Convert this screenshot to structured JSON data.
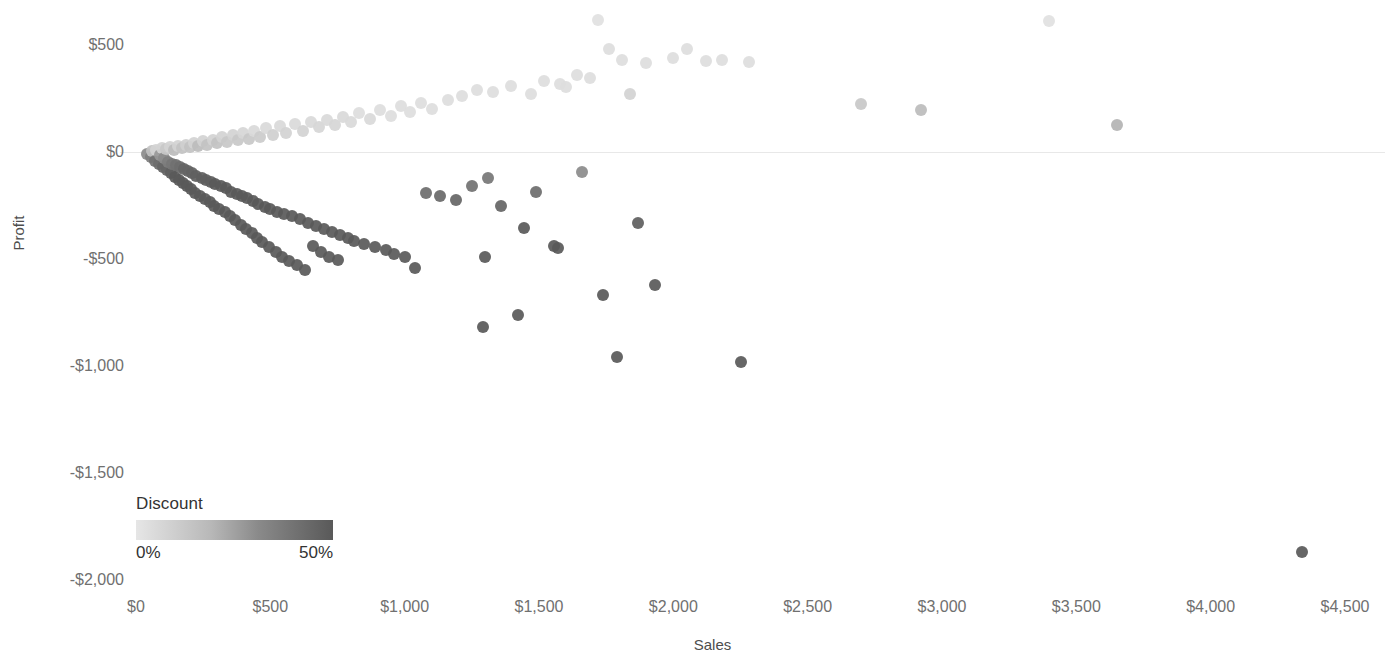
{
  "chart_data": {
    "type": "scatter",
    "title": "",
    "xlabel": "Sales",
    "ylabel": "Profit",
    "xlim": [
      0,
      4650
    ],
    "ylim": [
      -2000,
      650
    ],
    "grid": false,
    "x_tick_labels": [
      "$0",
      "$500",
      "$1,000",
      "$1,500",
      "$2,000",
      "$2,500",
      "$3,000",
      "$3,500",
      "$4,000",
      "$4,500"
    ],
    "x_tick_values": [
      0,
      500,
      1000,
      1500,
      2000,
      2500,
      3000,
      3500,
      4000,
      4500
    ],
    "y_tick_labels": [
      "$500",
      "$0",
      "-$500",
      "-$1,000",
      "-$1,500",
      "-$2,000"
    ],
    "y_tick_values": [
      500,
      0,
      -500,
      -1000,
      -1500,
      -2000
    ],
    "reference_line_y": 0,
    "color_encoding": {
      "field": "Discount",
      "min_label": "0%",
      "max_label": "50%",
      "min_value": 0,
      "max_value": 0.5,
      "min_color": "#e6e6e6",
      "max_color": "#595959",
      "legend_position": "bottom-left"
    },
    "marker": {
      "shape": "circle",
      "size_px": 12,
      "opacity": 0.92
    },
    "points": [
      [
        40,
        -10,
        0.3
      ],
      [
        55,
        -25,
        0.35
      ],
      [
        60,
        5,
        0.1
      ],
      [
        70,
        -40,
        0.4
      ],
      [
        75,
        10,
        0.05
      ],
      [
        85,
        -55,
        0.42
      ],
      [
        90,
        -15,
        0.25
      ],
      [
        95,
        20,
        0.05
      ],
      [
        100,
        -70,
        0.45
      ],
      [
        105,
        -30,
        0.3
      ],
      [
        110,
        15,
        0.08
      ],
      [
        115,
        -85,
        0.45
      ],
      [
        120,
        -45,
        0.35
      ],
      [
        125,
        25,
        0.05
      ],
      [
        130,
        -100,
        0.48
      ],
      [
        135,
        -55,
        0.38
      ],
      [
        140,
        8,
        0.12
      ],
      [
        145,
        -115,
        0.5
      ],
      [
        150,
        -60,
        0.4
      ],
      [
        155,
        30,
        0.05
      ],
      [
        160,
        -130,
        0.5
      ],
      [
        165,
        -70,
        0.42
      ],
      [
        170,
        18,
        0.1
      ],
      [
        175,
        -145,
        0.5
      ],
      [
        180,
        -80,
        0.45
      ],
      [
        185,
        35,
        0.06
      ],
      [
        190,
        -160,
        0.5
      ],
      [
        195,
        -90,
        0.45
      ],
      [
        200,
        22,
        0.1
      ],
      [
        205,
        -175,
        0.5
      ],
      [
        210,
        -100,
        0.46
      ],
      [
        215,
        42,
        0.05
      ],
      [
        220,
        -190,
        0.5
      ],
      [
        225,
        -110,
        0.47
      ],
      [
        230,
        28,
        0.12
      ],
      [
        240,
        -205,
        0.5
      ],
      [
        245,
        -120,
        0.48
      ],
      [
        250,
        50,
        0.05
      ],
      [
        255,
        -220,
        0.5
      ],
      [
        260,
        -130,
        0.48
      ],
      [
        265,
        35,
        0.1
      ],
      [
        275,
        -235,
        0.5
      ],
      [
        280,
        -140,
        0.48
      ],
      [
        285,
        58,
        0.05
      ],
      [
        290,
        -250,
        0.5
      ],
      [
        295,
        -150,
        0.5
      ],
      [
        300,
        40,
        0.1
      ],
      [
        310,
        -265,
        0.5
      ],
      [
        315,
        -160,
        0.5
      ],
      [
        320,
        68,
        0.05
      ],
      [
        330,
        -280,
        0.5
      ],
      [
        335,
        -170,
        0.5
      ],
      [
        340,
        48,
        0.08
      ],
      [
        350,
        -300,
        0.5
      ],
      [
        355,
        -185,
        0.5
      ],
      [
        360,
        78,
        0.05
      ],
      [
        370,
        -320,
        0.5
      ],
      [
        375,
        -195,
        0.5
      ],
      [
        380,
        55,
        0.08
      ],
      [
        390,
        -340,
        0.5
      ],
      [
        395,
        -205,
        0.5
      ],
      [
        400,
        88,
        0.04
      ],
      [
        410,
        -360,
        0.5
      ],
      [
        415,
        -215,
        0.5
      ],
      [
        420,
        62,
        0.08
      ],
      [
        430,
        -380,
        0.5
      ],
      [
        435,
        -230,
        0.5
      ],
      [
        440,
        98,
        0.03
      ],
      [
        450,
        -400,
        0.5
      ],
      [
        455,
        -245,
        0.5
      ],
      [
        460,
        70,
        0.07
      ],
      [
        470,
        -420,
        0.5
      ],
      [
        480,
        -255,
        0.5
      ],
      [
        485,
        110,
        0.03
      ],
      [
        495,
        -445,
        0.5
      ],
      [
        500,
        -265,
        0.5
      ],
      [
        510,
        80,
        0.06
      ],
      [
        520,
        -465,
        0.5
      ],
      [
        525,
        -280,
        0.5
      ],
      [
        535,
        120,
        0.03
      ],
      [
        545,
        -490,
        0.5
      ],
      [
        550,
        -290,
        0.5
      ],
      [
        560,
        90,
        0.05
      ],
      [
        570,
        -510,
        0.5
      ],
      [
        580,
        -300,
        0.5
      ],
      [
        590,
        130,
        0.03
      ],
      [
        600,
        -530,
        0.5
      ],
      [
        610,
        -315,
        0.5
      ],
      [
        620,
        100,
        0.05
      ],
      [
        630,
        -550,
        0.5
      ],
      [
        640,
        -330,
        0.5
      ],
      [
        650,
        140,
        0.03
      ],
      [
        660,
        -440,
        0.5
      ],
      [
        670,
        -345,
        0.5
      ],
      [
        680,
        115,
        0.04
      ],
      [
        690,
        -465,
        0.5
      ],
      [
        700,
        -360,
        0.5
      ],
      [
        710,
        150,
        0.03
      ],
      [
        720,
        -490,
        0.5
      ],
      [
        730,
        -375,
        0.5
      ],
      [
        740,
        125,
        0.04
      ],
      [
        750,
        -505,
        0.5
      ],
      [
        760,
        -390,
        0.5
      ],
      [
        770,
        165,
        0.03
      ],
      [
        790,
        -400,
        0.5
      ],
      [
        800,
        140,
        0.03
      ],
      [
        810,
        -415,
        0.5
      ],
      [
        830,
        180,
        0.02
      ],
      [
        850,
        -430,
        0.5
      ],
      [
        870,
        155,
        0.03
      ],
      [
        890,
        -445,
        0.5
      ],
      [
        910,
        195,
        0.02
      ],
      [
        930,
        -460,
        0.5
      ],
      [
        950,
        170,
        0.02
      ],
      [
        960,
        -475,
        0.5
      ],
      [
        985,
        215,
        0.02
      ],
      [
        1000,
        -490,
        0.5
      ],
      [
        1020,
        185,
        0.02
      ],
      [
        1040,
        -540,
        0.5
      ],
      [
        1060,
        230,
        0.02
      ],
      [
        1080,
        -190,
        0.42
      ],
      [
        1100,
        200,
        0.02
      ],
      [
        1130,
        -205,
        0.44
      ],
      [
        1160,
        245,
        0.02
      ],
      [
        1190,
        -225,
        0.45
      ],
      [
        1215,
        260,
        0.02
      ],
      [
        1250,
        -160,
        0.4
      ],
      [
        1270,
        290,
        0.02
      ],
      [
        1290,
        -820,
        0.5
      ],
      [
        1300,
        -490,
        0.5
      ],
      [
        1310,
        -120,
        0.38
      ],
      [
        1330,
        280,
        0.02
      ],
      [
        1360,
        -250,
        0.45
      ],
      [
        1395,
        310,
        0.02
      ],
      [
        1420,
        -760,
        0.5
      ],
      [
        1445,
        -355,
        0.5
      ],
      [
        1470,
        270,
        0.02
      ],
      [
        1490,
        -185,
        0.42
      ],
      [
        1520,
        330,
        0.02
      ],
      [
        1555,
        -440,
        0.5
      ],
      [
        1570,
        -450,
        0.5
      ],
      [
        1580,
        320,
        0.02
      ],
      [
        1600,
        305,
        0.02
      ],
      [
        1640,
        360,
        0.02
      ],
      [
        1660,
        -95,
        0.3
      ],
      [
        1690,
        345,
        0.02
      ],
      [
        1720,
        615,
        0.01
      ],
      [
        1740,
        -670,
        0.5
      ],
      [
        1760,
        480,
        0.02
      ],
      [
        1790,
        -960,
        0.5
      ],
      [
        1810,
        430,
        0.02
      ],
      [
        1840,
        270,
        0.05
      ],
      [
        1870,
        -330,
        0.48
      ],
      [
        1900,
        415,
        0.02
      ],
      [
        1930,
        -620,
        0.5
      ],
      [
        2000,
        440,
        0.02
      ],
      [
        2050,
        480,
        0.02
      ],
      [
        2120,
        425,
        0.02
      ],
      [
        2180,
        430,
        0.02
      ],
      [
        2250,
        -980,
        0.5
      ],
      [
        2280,
        420,
        0.02
      ],
      [
        2700,
        225,
        0.08
      ],
      [
        2920,
        195,
        0.12
      ],
      [
        3400,
        610,
        0.01
      ],
      [
        3650,
        125,
        0.15
      ],
      [
        4340,
        -1870,
        0.5
      ]
    ]
  },
  "legend": {
    "title": "Discount",
    "min_label": "0%",
    "max_label": "50%"
  },
  "axes": {
    "x_title": "Sales",
    "y_title": "Profit"
  }
}
